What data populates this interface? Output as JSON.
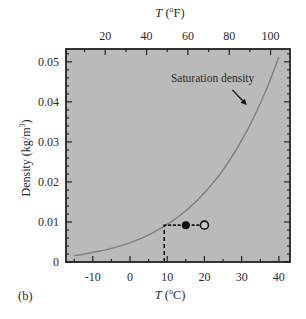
{
  "chart_data": {
    "type": "line",
    "panel_label": "(b)",
    "title": "",
    "xlabel": "T (°C)",
    "xlabel_parts": {
      "var": "T",
      "unit_pre": " (",
      "deg": "o",
      "unit": "C)"
    },
    "x2label": "T (°F)",
    "x2label_parts": {
      "var": "T",
      "unit_pre": " (",
      "deg": "o",
      "unit": "F)"
    },
    "ylabel": "Density (kg/m³)",
    "ylabel_parts": {
      "text": "Density (kg/m",
      "sup": "3",
      "close": ")"
    },
    "xlim": [
      -17.2,
      43
    ],
    "ylim": [
      0,
      0.0532
    ],
    "x_ticks": [
      -10,
      0,
      10,
      20,
      30,
      40
    ],
    "x_tick_labels": [
      "-10",
      "0",
      "10",
      "20",
      "30",
      "40"
    ],
    "x2_ticks_F": [
      20,
      40,
      60,
      80,
      100
    ],
    "x2_tick_labels": [
      "20",
      "40",
      "60",
      "80",
      "100"
    ],
    "y_ticks": [
      0,
      0.01,
      0.02,
      0.03,
      0.04,
      0.05
    ],
    "y_tick_labels": [
      "0",
      "0.01",
      "0.02",
      "0.03",
      "0.04",
      "0.05"
    ],
    "grid": false,
    "legend": "none",
    "series": [
      {
        "name": "Saturation density",
        "x": [
          -15,
          -10,
          -5,
          0,
          5,
          10,
          15,
          20,
          25,
          30,
          35,
          40
        ],
        "values": [
          0.0016,
          0.0024,
          0.0034,
          0.0048,
          0.0068,
          0.0094,
          0.0128,
          0.0173,
          0.023,
          0.0304,
          0.0396,
          0.0512
        ],
        "color": "#7f7f7f"
      }
    ],
    "annotations": [
      {
        "type": "label",
        "text": "Saturation density",
        "x": 11,
        "y": 0.0449
      },
      {
        "type": "arrow",
        "from": [
          27.5,
          0.043
        ],
        "to": [
          31.4,
          0.0392
        ]
      },
      {
        "type": "filled_point",
        "x": 15,
        "y": 0.0092
      },
      {
        "type": "open_point",
        "x": 20,
        "y": 0.0092
      },
      {
        "type": "dotted_hline",
        "x_from": 9.2,
        "x_to": 20,
        "y": 0.0092
      },
      {
        "type": "dashed_vline",
        "x": 9.2,
        "y_from": 0,
        "y_to": 0.0092
      }
    ],
    "colors": {
      "plot_background": "#bababa",
      "curve": "#7f7f7f",
      "axes": "#222222",
      "points": "#111111"
    }
  }
}
